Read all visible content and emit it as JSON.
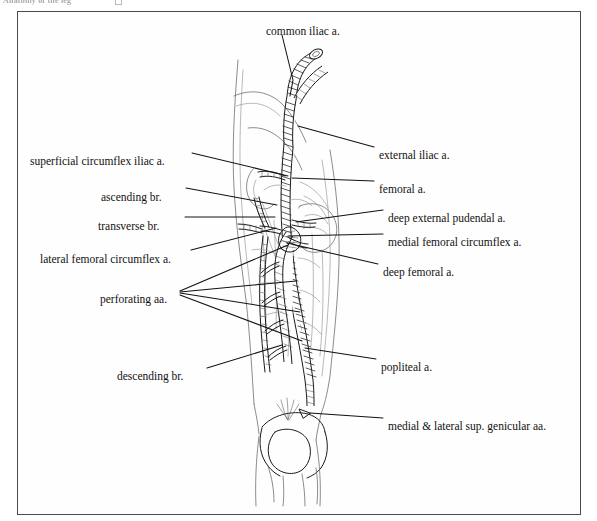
{
  "page": {
    "header_remnant": "Anatomy of the leg",
    "figure_title": "Arteries of the lower limb"
  },
  "figure": {
    "frame": {
      "x": 17,
      "y": 11,
      "width": 564,
      "height": 504
    },
    "background_color": "#ffffff",
    "ink_color": "#111111",
    "frame_color": "#4a4a4a"
  },
  "labels": {
    "top": [
      {
        "id": "common-iliac",
        "text": "common iliac a.",
        "x": 266,
        "y": 26,
        "anchor": "start"
      }
    ],
    "left": [
      {
        "id": "superficial-circumflex-iliac",
        "text": "superficial circumflex iliac a.",
        "x": 30,
        "y": 156,
        "anchor": "start"
      },
      {
        "id": "ascending-br",
        "text": "ascending br.",
        "x": 101,
        "y": 192,
        "anchor": "start"
      },
      {
        "id": "transverse-br",
        "text": "transverse br.",
        "x": 98,
        "y": 221,
        "anchor": "start"
      },
      {
        "id": "lateral-femoral-circumflex",
        "text": "lateral femoral circumflex a.",
        "x": 40,
        "y": 254,
        "anchor": "start"
      },
      {
        "id": "perforating-aa",
        "text": "perforating aa.",
        "x": 100,
        "y": 294,
        "anchor": "start"
      },
      {
        "id": "descending-br",
        "text": "descending br.",
        "x": 117,
        "y": 371,
        "anchor": "start"
      }
    ],
    "right": [
      {
        "id": "external-iliac",
        "text": "external iliac a.",
        "x": 379,
        "y": 150,
        "anchor": "start"
      },
      {
        "id": "femoral",
        "text": "femoral a.",
        "x": 379,
        "y": 184,
        "anchor": "start"
      },
      {
        "id": "deep-external-pudendal",
        "text": "deep external pudendal a.",
        "x": 388,
        "y": 213,
        "anchor": "start"
      },
      {
        "id": "medial-femoral-circumflex",
        "text": "medial femoral circumflex a.",
        "x": 388,
        "y": 237,
        "anchor": "start"
      },
      {
        "id": "deep-femoral",
        "text": "deep femoral a.",
        "x": 383,
        "y": 267,
        "anchor": "start"
      },
      {
        "id": "popliteal",
        "text": "popliteal a.",
        "x": 381,
        "y": 362,
        "anchor": "start"
      },
      {
        "id": "medial-lateral-sup-genicular",
        "text": "medial & lateral sup. genicular aa.",
        "x": 388,
        "y": 421,
        "anchor": "start"
      }
    ]
  },
  "leader_lines": [
    {
      "for": "common-iliac",
      "points": "282,35 293,80 290,96"
    },
    {
      "for": "superficial-circumflex-iliac",
      "points": "192,153 288,176"
    },
    {
      "for": "ascending-br",
      "points": "186,188 277,205"
    },
    {
      "for": "transverse-br",
      "points": "185,217 275,217"
    },
    {
      "for": "lateral-femoral-circumflex",
      "points": "191,250 276,228"
    },
    {
      "for": "perforating-aa",
      "points": "180,291 288,245"
    },
    {
      "for": "perforating-aa",
      "points": "180,292 296,281"
    },
    {
      "for": "perforating-aa",
      "points": "180,293 300,312"
    },
    {
      "for": "perforating-aa",
      "points": "180,295 302,341"
    },
    {
      "for": "descending-br",
      "points": "207,368 282,345"
    },
    {
      "for": "external-iliac",
      "points": "374,147 298,126"
    },
    {
      "for": "femoral",
      "points": "374,181 292,178"
    },
    {
      "for": "deep-external-pudendal",
      "points": "383,210 296,222"
    },
    {
      "for": "medial-femoral-circumflex",
      "points": "383,234 288,236"
    },
    {
      "for": "deep-femoral",
      "points": "378,264 287,243"
    },
    {
      "for": "popliteal",
      "points": "376,359 305,348"
    },
    {
      "for": "medial-lateral-sup-genicular",
      "points": "383,418 310,413"
    }
  ],
  "illustration": {
    "type": "line-drawing",
    "subject": "right lower limb arterial tree, anterior view",
    "regions": [
      "common iliac bifurcation",
      "external iliac artery",
      "femoral artery",
      "deep femoral artery with perforating branches",
      "lateral femoral circumflex artery (ascending, transverse, descending branches)",
      "medial femoral circumflex artery",
      "popliteal artery",
      "knee joint with patella",
      "superior genicular arteries"
    ]
  }
}
